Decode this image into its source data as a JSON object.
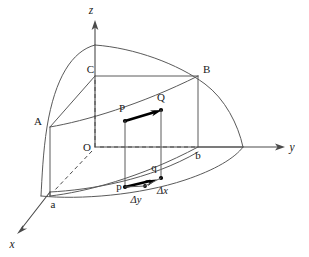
{
  "figure": {
    "background_color": "#ffffff",
    "line_color": "#5a5a5a",
    "accent_color": "#000000"
  },
  "axes": [
    {
      "id": "z",
      "label": "z",
      "orientation": "up"
    },
    {
      "id": "y",
      "label": "y",
      "orientation": "right"
    },
    {
      "id": "x",
      "label": "x",
      "orientation": "down-left"
    }
  ],
  "vertices": [
    {
      "id": "A",
      "label": "A"
    },
    {
      "id": "B",
      "label": "B"
    },
    {
      "id": "C",
      "label": "C"
    },
    {
      "id": "O",
      "label": "O"
    },
    {
      "id": "a",
      "label": "a"
    },
    {
      "id": "b",
      "label": "b"
    }
  ],
  "points": [
    {
      "id": "P_upper",
      "label": "P"
    },
    {
      "id": "Q_upper",
      "label": "Q"
    },
    {
      "id": "p_lower",
      "label": "p"
    },
    {
      "id": "q_lower",
      "label": "q"
    }
  ],
  "increments": [
    {
      "id": "delta_x",
      "label": "Δx"
    },
    {
      "id": "delta_y",
      "label": "Δy"
    }
  ],
  "vectors": [
    {
      "id": "PQ",
      "from": "P",
      "to": "Q",
      "style": "bold-arrow"
    },
    {
      "id": "pq",
      "from": "p",
      "to": "q",
      "style": "bold-arrow"
    }
  ]
}
